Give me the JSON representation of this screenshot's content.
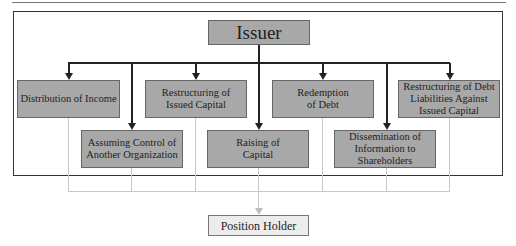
{
  "diagram": {
    "root": {
      "label": "Issuer"
    },
    "top_row": [
      {
        "label": "Distribution of Income"
      },
      {
        "label": "Restructuring of Issued Capital"
      },
      {
        "label": "Redemption of Debt"
      },
      {
        "label": "Restructuring of Debt Liabilities Against Issued Capital"
      }
    ],
    "bottom_row": [
      {
        "label": "Assuming Control of Another Organization"
      },
      {
        "label": "Raising of Capital"
      },
      {
        "label": "Dissemination of Information to Shareholders"
      }
    ],
    "target": {
      "label": "Position Holder"
    },
    "colors": {
      "box_fill": "#a8a8a8",
      "target_fill": "#ececec",
      "connector": "#222222",
      "feed_line": "#c8c8c8"
    }
  }
}
